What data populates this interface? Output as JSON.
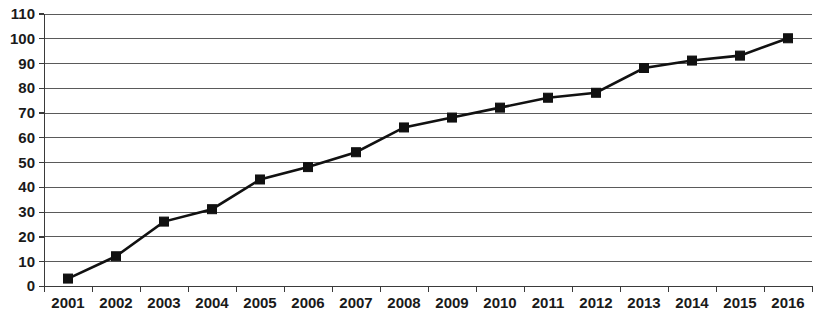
{
  "chart_data": {
    "type": "line",
    "title": "",
    "subtitle": "",
    "xlabel": "",
    "ylabel": "",
    "categories": [
      "2001",
      "2002",
      "2003",
      "2004",
      "2005",
      "2006",
      "2007",
      "2008",
      "2009",
      "2010",
      "2011",
      "2012",
      "2013",
      "2014",
      "2015",
      "2016"
    ],
    "series": [
      {
        "name": "",
        "values": [
          3,
          12,
          26,
          31,
          43,
          48,
          54,
          64,
          68,
          72,
          76,
          78,
          88,
          91,
          93,
          100
        ]
      }
    ],
    "ylim": [
      0,
      110
    ],
    "y_ticks": [
      0,
      10,
      20,
      30,
      40,
      50,
      60,
      70,
      80,
      90,
      100,
      110
    ],
    "y_tick_labels": [
      "0",
      "10",
      "20",
      "30",
      "40",
      "50",
      "60",
      "70",
      "80",
      "90",
      "100",
      "110"
    ],
    "x_tick_labels": [
      "2001",
      "2002",
      "2003",
      "2004",
      "2005",
      "2006",
      "2007",
      "2008",
      "2009",
      "2010",
      "2011",
      "2012",
      "2013",
      "2014",
      "2015",
      "2016"
    ],
    "grid": true,
    "grid_axis": "y",
    "legend": false,
    "legend_position": "none",
    "marker": "square",
    "line_color": "#111111",
    "marker_color": "#111111",
    "grid_color": "#5a5a5a",
    "background_color": "#ffffff"
  }
}
